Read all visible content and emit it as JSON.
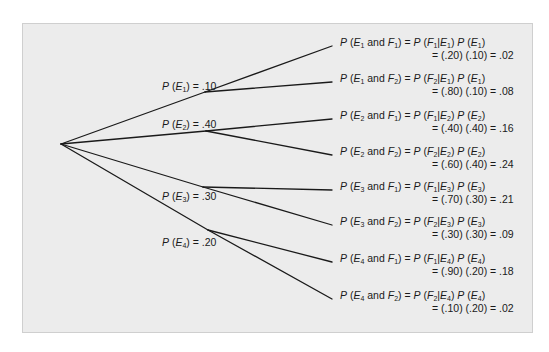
{
  "diagram": {
    "type": "probability-tree",
    "colors": {
      "panel_background": "#ececec",
      "panel_border": "#cfcfcf",
      "line": "#1a1a1a",
      "text": "#1a1a1a"
    },
    "root": {
      "x": 61,
      "y": 144
    },
    "first_stage": [
      {
        "event": "E1",
        "label": "P (E1) = .10",
        "p": ".10",
        "sub": "1",
        "node": {
          "x": 205,
          "y": 92
        },
        "label_pos": {
          "x": 162,
          "y": 80
        }
      },
      {
        "event": "E2",
        "label": "P (E2) = .40",
        "p": ".40",
        "sub": "2",
        "node": {
          "x": 206,
          "y": 131
        },
        "label_pos": {
          "x": 162,
          "y": 118
        }
      },
      {
        "event": "E3",
        "label": "P (E3) = .30",
        "p": ".30",
        "sub": "3",
        "node": {
          "x": 203,
          "y": 187
        },
        "label_pos": {
          "x": 162,
          "y": 190
        }
      },
      {
        "event": "E4",
        "label": "P (E4) = .20",
        "p": ".20",
        "sub": "4",
        "node": {
          "x": 208,
          "y": 230
        },
        "label_pos": {
          "x": 162,
          "y": 236
        }
      }
    ],
    "outcomes": [
      {
        "e": "1",
        "f": "1",
        "line1": "P (E1 and F1) = P (F1|E1) P (E1)",
        "line2": "= (.20) (.10) = .02",
        "cond": "(.20)",
        "prior": "(.10)",
        "result": ".02",
        "end": {
          "x": 332,
          "y": 46
        }
      },
      {
        "e": "1",
        "f": "2",
        "line1": "P (E1 and F2) = P (F2|E1) P (E1)",
        "line2": "= (.80) (.10) = .08",
        "cond": "(.80)",
        "prior": "(.10)",
        "result": ".08",
        "end": {
          "x": 332,
          "y": 82
        }
      },
      {
        "e": "2",
        "f": "1",
        "line1": "P (E2 and F1) = P (F1|E2) P (E2)",
        "line2": "= (.40) (.40) = .16",
        "cond": "(.40)",
        "prior": "(.40)",
        "result": ".16",
        "end": {
          "x": 332,
          "y": 119
        }
      },
      {
        "e": "2",
        "f": "2",
        "line1": "P (E2 and F2) = P (F2|E2) P (E2)",
        "line2": "= (.60) (.40) = .24",
        "cond": "(.60)",
        "prior": "(.40)",
        "result": ".24",
        "end": {
          "x": 332,
          "y": 155
        }
      },
      {
        "e": "3",
        "f": "1",
        "line1": "P (E3 and F1) = P (F1|E3) P (E3)",
        "line2": "= (.70) (.30) = .21",
        "cond": "(.70)",
        "prior": "(.30)",
        "result": ".21",
        "end": {
          "x": 332,
          "y": 190
        }
      },
      {
        "e": "3",
        "f": "2",
        "line1": "P (E3 and F2) = P (F2|E3) P (E3)",
        "line2": "= (.30) (.30) = .09",
        "cond": "(.30)",
        "prior": "(.30)",
        "result": ".09",
        "end": {
          "x": 332,
          "y": 225
        }
      },
      {
        "e": "4",
        "f": "1",
        "line1": "P (E4 and F1) = P (F1|E4) P (E4)",
        "line2": "= (.90) (.20) = .18",
        "cond": "(.90)",
        "prior": "(.20)",
        "result": ".18",
        "end": {
          "x": 332,
          "y": 262
        }
      },
      {
        "e": "4",
        "f": "2",
        "line1": "P (E4 and F2) = P (F2|E4) P (E4)",
        "line2": "= (.10) (.20) = .02",
        "cond": "(.10)",
        "prior": "(.20)",
        "result": ".02",
        "end": {
          "x": 332,
          "y": 299
        }
      }
    ]
  }
}
